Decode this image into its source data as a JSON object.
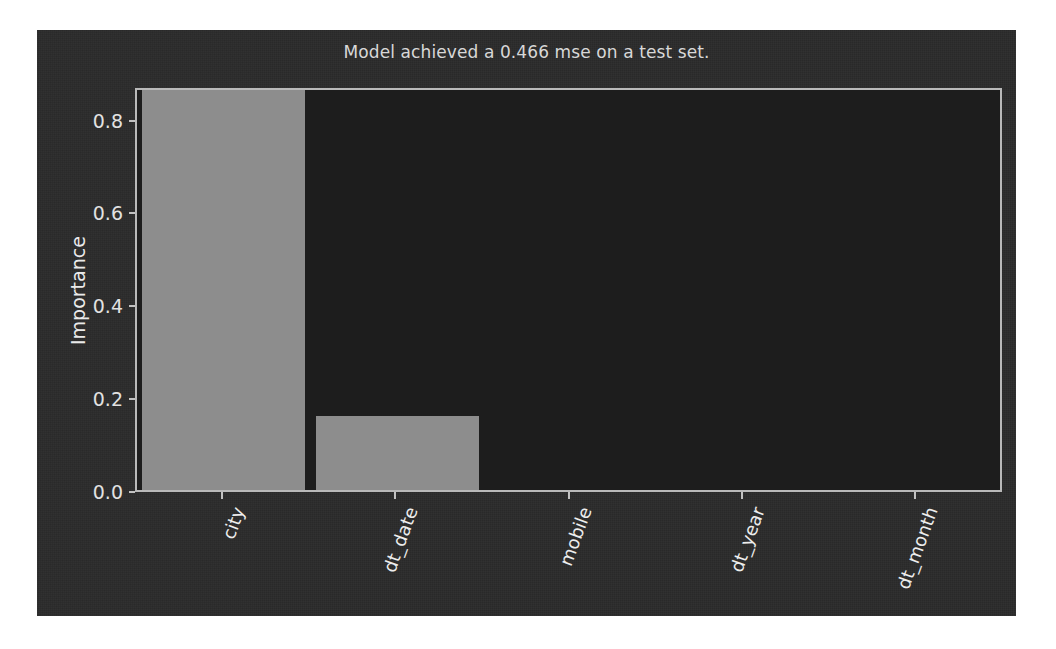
{
  "chart_data": {
    "type": "bar",
    "title": "Model achieved a 0.466 mse on a test set.",
    "xlabel": "",
    "ylabel": "Importance",
    "categories": [
      "city",
      "dt_date",
      "mobile",
      "dt_year",
      "dt_month"
    ],
    "values": [
      0.865,
      0.16,
      0.0,
      0.0,
      0.0
    ],
    "ylim": [
      0.0,
      0.87
    ],
    "yticks": [
      0.0,
      0.2,
      0.4,
      0.6,
      0.8
    ],
    "ytick_labels": [
      "0.0",
      "0.2",
      "0.4",
      "0.6",
      "0.8"
    ],
    "grid": false,
    "legend": false,
    "legend_position": "none",
    "xtick_rotation": -70,
    "colors": {
      "figure_background": "#2b2b2b",
      "axes_background": "#1d1d1d",
      "bar": "#8d8d8d",
      "axis_line": "#b9b9b9",
      "text": "#e2e2e2",
      "title": "#d8d8d8"
    }
  }
}
